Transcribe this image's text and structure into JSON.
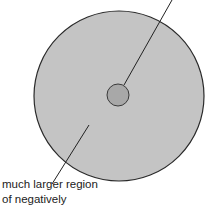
{
  "diagram": {
    "outer_circle": {
      "cx": 119,
      "cy": 96,
      "r": 85,
      "fill": "#c4c4c4",
      "stroke": "#2a2a2a"
    },
    "inner_circle": {
      "cx": 118,
      "cy": 95,
      "r": 11,
      "fill": "#a8a8a8",
      "stroke": "#3a3a3a"
    },
    "labels": [
      {
        "text": "much larger region",
        "x": 2,
        "y": 180
      },
      {
        "text": "of negatively",
        "x": 2,
        "y": 195
      }
    ]
  }
}
